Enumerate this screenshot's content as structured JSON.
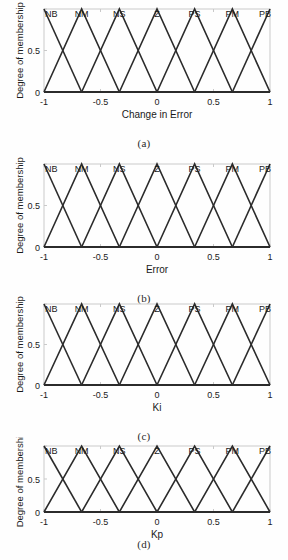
{
  "figure": {
    "background": "#fefefe",
    "axis_color": "#c9c9c9",
    "curve_color": "#2b2b2b",
    "text_color": "#1a1a1a"
  },
  "chart_data": [
    {
      "type": "line",
      "title": "",
      "xlabel": "Change in Error",
      "ylabel": "Degree of membership",
      "xlim": [
        -1,
        1
      ],
      "ylim": [
        0,
        1
      ],
      "xticks": [
        -1,
        -0.5,
        0,
        0.5,
        1
      ],
      "xticklabels": [
        "-1",
        "-0.5",
        "0",
        "0.5",
        "1"
      ],
      "yticks": [
        0,
        0.5,
        1
      ],
      "yticklabels": [
        "0",
        "0.5",
        ""
      ],
      "grid": false,
      "legend": "none",
      "annotations": [
        "NB",
        "NM",
        "NS",
        "Z",
        "PS",
        "PM",
        "PB"
      ],
      "annotation_x": [
        -1,
        -0.667,
        -0.333,
        0,
        0.333,
        0.667,
        1
      ],
      "series": [
        {
          "name": "NB",
          "x": [
            -1,
            -0.667
          ],
          "values": [
            1,
            0
          ]
        },
        {
          "name": "NM",
          "x": [
            -1,
            -0.667,
            -0.333
          ],
          "values": [
            0,
            1,
            0
          ]
        },
        {
          "name": "NS",
          "x": [
            -0.667,
            -0.333,
            0
          ],
          "values": [
            0,
            1,
            0
          ]
        },
        {
          "name": "Z",
          "x": [
            -0.333,
            0,
            0.333
          ],
          "values": [
            0,
            1,
            0
          ]
        },
        {
          "name": "PS",
          "x": [
            0,
            0.333,
            0.667
          ],
          "values": [
            0,
            1,
            0
          ]
        },
        {
          "name": "PM",
          "x": [
            0.333,
            0.667,
            1
          ],
          "values": [
            0,
            1,
            0
          ]
        },
        {
          "name": "PB",
          "x": [
            0.667,
            1
          ],
          "values": [
            0,
            1
          ]
        }
      ],
      "caption": "(a)"
    },
    {
      "type": "line",
      "title": "",
      "xlabel": "Error",
      "ylabel": "Degree of membership",
      "xlim": [
        -1,
        1
      ],
      "ylim": [
        0,
        1
      ],
      "xticks": [
        -1,
        -0.5,
        0,
        0.5,
        1
      ],
      "xticklabels": [
        "-1",
        "-0.5",
        "0",
        "0.5",
        "1"
      ],
      "yticks": [
        0,
        0.5,
        1
      ],
      "yticklabels": [
        "0",
        "0.5",
        ""
      ],
      "grid": false,
      "legend": "none",
      "annotations": [
        "NB",
        "NM",
        "NS",
        "Z",
        "PS",
        "PM",
        "PB"
      ],
      "annotation_x": [
        -1,
        -0.667,
        -0.333,
        0,
        0.333,
        0.667,
        1
      ],
      "series": [
        {
          "name": "NB",
          "x": [
            -1,
            -0.667
          ],
          "values": [
            1,
            0
          ]
        },
        {
          "name": "NM",
          "x": [
            -1,
            -0.667,
            -0.333
          ],
          "values": [
            0,
            1,
            0
          ]
        },
        {
          "name": "NS",
          "x": [
            -0.667,
            -0.333,
            0
          ],
          "values": [
            0,
            1,
            0
          ]
        },
        {
          "name": "Z",
          "x": [
            -0.333,
            0,
            0.333
          ],
          "values": [
            0,
            1,
            0
          ]
        },
        {
          "name": "PS",
          "x": [
            0,
            0.333,
            0.667
          ],
          "values": [
            0,
            1,
            0
          ]
        },
        {
          "name": "PM",
          "x": [
            0.333,
            0.667,
            1
          ],
          "values": [
            0,
            1,
            0
          ]
        },
        {
          "name": "PB",
          "x": [
            0.667,
            1
          ],
          "values": [
            0,
            1
          ]
        }
      ],
      "caption": "(b)"
    },
    {
      "type": "line",
      "title": "",
      "xlabel": "Ki",
      "ylabel": "Degree of membership",
      "xlim": [
        -1,
        1
      ],
      "ylim": [
        0,
        1
      ],
      "xticks": [
        -1,
        -0.5,
        0,
        0.5,
        1
      ],
      "xticklabels": [
        "-1",
        "-0.5",
        "0",
        "0.5",
        "1"
      ],
      "yticks": [
        0,
        0.5,
        1
      ],
      "yticklabels": [
        "0",
        "0.5",
        ""
      ],
      "grid": false,
      "legend": "none",
      "annotations": [
        "NB",
        "NM",
        "NS",
        "Z",
        "PS",
        "PM",
        "PB"
      ],
      "annotation_x": [
        -1,
        -0.667,
        -0.333,
        0,
        0.333,
        0.667,
        1
      ],
      "series": [
        {
          "name": "NB",
          "x": [
            -1,
            -0.667
          ],
          "values": [
            1,
            0
          ]
        },
        {
          "name": "NM",
          "x": [
            -1,
            -0.667,
            -0.333
          ],
          "values": [
            0,
            1,
            0
          ]
        },
        {
          "name": "NS",
          "x": [
            -0.667,
            -0.333,
            0
          ],
          "values": [
            0,
            1,
            0
          ]
        },
        {
          "name": "Z",
          "x": [
            -0.333,
            0,
            0.333
          ],
          "values": [
            0,
            1,
            0
          ]
        },
        {
          "name": "PS",
          "x": [
            0,
            0.333,
            0.667
          ],
          "values": [
            0,
            1,
            0
          ]
        },
        {
          "name": "PM",
          "x": [
            0.333,
            0.667,
            1
          ],
          "values": [
            0,
            1,
            0
          ]
        },
        {
          "name": "PB",
          "x": [
            0.667,
            1
          ],
          "values": [
            0,
            1
          ]
        }
      ],
      "caption": "(c)"
    },
    {
      "type": "line",
      "title": "",
      "xlabel": "Kp",
      "ylabel": "Degree of membership",
      "xlim": [
        -1,
        1
      ],
      "ylim": [
        0,
        1
      ],
      "xticks": [
        -1,
        -0.5,
        0,
        0.5,
        1
      ],
      "xticklabels": [
        "-1",
        "-0.5",
        "0",
        "0.5",
        "1"
      ],
      "yticks": [
        0,
        0.5,
        1
      ],
      "yticklabels": [
        "0",
        "0.5",
        ""
      ],
      "grid": false,
      "legend": "none",
      "annotations": [
        "NB",
        "NM",
        "NS",
        "Z",
        "PS",
        "PM",
        "PB"
      ],
      "annotation_x": [
        -1,
        -0.667,
        -0.333,
        0,
        0.333,
        0.667,
        1
      ],
      "series": [
        {
          "name": "NB",
          "x": [
            -1,
            -0.667
          ],
          "values": [
            1,
            0
          ]
        },
        {
          "name": "NM",
          "x": [
            -1,
            -0.667,
            -0.333
          ],
          "values": [
            0,
            1,
            0
          ]
        },
        {
          "name": "NS",
          "x": [
            -0.667,
            -0.333,
            0
          ],
          "values": [
            0,
            1,
            0
          ]
        },
        {
          "name": "Z",
          "x": [
            -0.333,
            0,
            0.333
          ],
          "values": [
            0,
            1,
            0
          ]
        },
        {
          "name": "PS",
          "x": [
            0,
            0.333,
            0.667
          ],
          "values": [
            0,
            1,
            0
          ]
        },
        {
          "name": "PM",
          "x": [
            0.333,
            0.667,
            1
          ],
          "values": [
            0,
            1,
            0
          ]
        },
        {
          "name": "PB",
          "x": [
            0.667,
            1
          ],
          "values": [
            0,
            1
          ]
        }
      ],
      "caption": "(d)"
    }
  ],
  "panel_geometry": [
    {
      "top": 0,
      "height": 136,
      "plot_left": 44,
      "plot_right": 270,
      "plot_top": 9,
      "plot_bottom": 92,
      "caption_top": 137
    },
    {
      "top": 155,
      "height": 136,
      "plot_left": 44,
      "plot_right": 270,
      "plot_top": 164,
      "plot_bottom": 247,
      "caption_top": 292
    },
    {
      "top": 295,
      "height": 134,
      "plot_left": 44,
      "plot_right": 270,
      "plot_top": 304,
      "plot_bottom": 385,
      "caption_top": 430
    },
    {
      "top": 437,
      "height": 118,
      "plot_left": 44,
      "plot_right": 270,
      "plot_top": 446,
      "plot_bottom": 512,
      "caption_top": 538
    }
  ]
}
